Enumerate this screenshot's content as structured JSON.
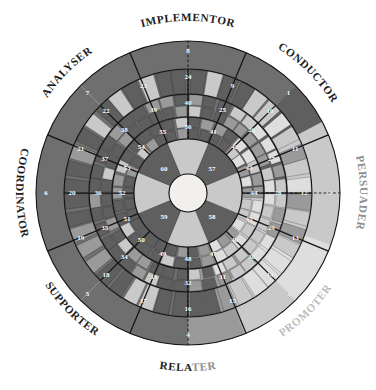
{
  "figure": {
    "type": "radial-segmented-wheel",
    "title_visible": false,
    "center_hub": "",
    "ring_count": 4,
    "sector_count": 8,
    "total_numbered_segments": 60
  },
  "colors": {
    "dark_gray": "#6f6f6f",
    "darker_gray": "#5f5f5f",
    "mid_gray": "#9a9a9a",
    "light_gray": "#c9c9c9",
    "pale_gray": "#dedede",
    "outline": "#141414",
    "hub": "#f2f0ec",
    "label_dark": "#1c1c1c",
    "label_mid": "#8d8d8d",
    "label_light": "#bdbdbd",
    "number_text": "#ffffff",
    "background": "#ffffff"
  },
  "sector_labels": [
    {
      "id": "implementor",
      "text": "IMPLEMENTOR",
      "tone": "dark",
      "position": "top"
    },
    {
      "id": "conductor",
      "text": "CONDUCTOR",
      "tone": "dark",
      "position": "top-right"
    },
    {
      "id": "persuader",
      "text": "PERSUADER",
      "tone": "mid",
      "position": "right"
    },
    {
      "id": "promoter",
      "text": "PROMOTER",
      "tone": "light",
      "position": "bottom-right"
    },
    {
      "id": "relater",
      "text": "RELATER",
      "tone": "split",
      "position": "bottom",
      "text_dark": "RELA",
      "text_light": "TER"
    },
    {
      "id": "supporter",
      "text": "SUPPORTER",
      "tone": "dark",
      "position": "bottom-left"
    },
    {
      "id": "coordinator",
      "text": "COORDINATOR",
      "tone": "dark",
      "position": "left"
    },
    {
      "id": "analyser",
      "text": "ANALYSER",
      "tone": "dark",
      "position": "top-left"
    }
  ],
  "chart_data": {
    "type": "pie",
    "title": "",
    "xlabel": "",
    "ylabel": "",
    "legend_position": "around-perimeter",
    "grid": false,
    "categories": [
      "IMPLEMENTOR",
      "CONDUCTOR",
      "PERSUADER",
      "PROMOTER",
      "RELATER",
      "SUPPORTER",
      "COORDINATOR",
      "ANALYSER"
    ],
    "values": [
      12.5,
      12.5,
      12.5,
      12.5,
      12.5,
      12.5,
      12.5,
      12.5
    ],
    "rings": [
      {
        "ring": 1,
        "name": "outer-ring",
        "segments": [
          {
            "n": 1,
            "sector": "CONDUCTOR",
            "shade": "dark"
          },
          {
            "n": 2,
            "sector": "PERSUADER",
            "shade": "dark"
          },
          {
            "n": 3,
            "sector": "PROMOTER",
            "shade": "pale"
          },
          {
            "n": 4,
            "sector": "RELATER",
            "shade": "light"
          },
          {
            "n": 5,
            "sector": "SUPPORTER",
            "shade": "dark"
          },
          {
            "n": 6,
            "sector": "COORDINATOR",
            "shade": "dark"
          },
          {
            "n": 7,
            "sector": "ANALYSER",
            "shade": "dark"
          },
          {
            "n": 8,
            "sector": "IMPLEMENTOR",
            "shade": "dark"
          }
        ]
      },
      {
        "ring": 2,
        "name": "second-ring",
        "segments": [
          {
            "n": 9,
            "sector": "IMPLEMENTOR",
            "shade": "dark"
          },
          {
            "n": 10,
            "sector": "CONDUCTOR",
            "shade": "dark"
          },
          {
            "n": 11,
            "sector": "CONDUCTOR",
            "shade": "dark"
          },
          {
            "n": 12,
            "sector": "PERSUADER",
            "shade": "dark"
          },
          {
            "n": 13,
            "sector": "PERSUADER",
            "shade": "light"
          },
          {
            "n": 14,
            "sector": "PROMOTER",
            "shade": "light"
          },
          {
            "n": 15,
            "sector": "PROMOTER",
            "shade": "light"
          },
          {
            "n": 16,
            "sector": "RELATER",
            "shade": "light"
          },
          {
            "n": 17,
            "sector": "RELATER",
            "shade": "light"
          },
          {
            "n": 18,
            "sector": "SUPPORTER",
            "shade": "dark"
          },
          {
            "n": 19,
            "sector": "SUPPORTER",
            "shade": "dark"
          },
          {
            "n": 20,
            "sector": "COORDINATOR",
            "shade": "dark"
          },
          {
            "n": 21,
            "sector": "COORDINATOR",
            "shade": "dark"
          },
          {
            "n": 22,
            "sector": "ANALYSER",
            "shade": "dark"
          },
          {
            "n": 23,
            "sector": "ANALYSER",
            "shade": "dark"
          },
          {
            "n": 24,
            "sector": "IMPLEMENTOR",
            "shade": "dark"
          }
        ]
      },
      {
        "ring": 3,
        "name": "third-ring",
        "segments": [
          {
            "n": 25,
            "sector": "IMPLEMENTOR",
            "shade": "mottled"
          },
          {
            "n": 26,
            "sector": "CONDUCTOR",
            "shade": "mottled"
          },
          {
            "n": 27,
            "sector": "CONDUCTOR",
            "shade": "mottled"
          },
          {
            "n": 28,
            "sector": "PERSUADER",
            "shade": "mottled"
          },
          {
            "n": 29,
            "sector": "PERSUADER",
            "shade": "mottled"
          },
          {
            "n": 30,
            "sector": "PERSUADER",
            "shade": "mottled"
          },
          {
            "n": 31,
            "sector": "PROMOTER",
            "shade": "mottled"
          },
          {
            "n": 32,
            "sector": "RELATER",
            "shade": "mottled"
          },
          {
            "n": 33,
            "sector": "RELATER",
            "shade": "mottled"
          },
          {
            "n": 34,
            "sector": "SUPPORTER",
            "shade": "mottled"
          },
          {
            "n": 35,
            "sector": "SUPPORTER",
            "shade": "mottled"
          },
          {
            "n": 36,
            "sector": "COORDINATOR",
            "shade": "mottled"
          },
          {
            "n": 37,
            "sector": "COORDINATOR",
            "shade": "mottled"
          },
          {
            "n": 38,
            "sector": "ANALYSER",
            "shade": "mottled"
          },
          {
            "n": 39,
            "sector": "ANALYSER",
            "shade": "mottled"
          },
          {
            "n": 40,
            "sector": "IMPLEMENTOR",
            "shade": "mottled"
          }
        ]
      },
      {
        "ring": 4,
        "name": "fourth-ring",
        "segments": [
          {
            "n": 41,
            "sector": "IMPLEMENTOR",
            "shade": "mottled"
          },
          {
            "n": 42,
            "sector": "CONDUCTOR",
            "shade": "mottled"
          },
          {
            "n": 43,
            "sector": "CONDUCTOR",
            "shade": "mottled"
          },
          {
            "n": 44,
            "sector": "PERSUADER",
            "shade": "mottled"
          },
          {
            "n": 45,
            "sector": "PERSUADER",
            "shade": "mottled"
          },
          {
            "n": 46,
            "sector": "PROMOTER",
            "shade": "mottled"
          },
          {
            "n": 47,
            "sector": "PROMOTER",
            "shade": "mottled"
          },
          {
            "n": 48,
            "sector": "RELATER",
            "shade": "mottled"
          },
          {
            "n": 49,
            "sector": "RELATER",
            "shade": "mottled"
          },
          {
            "n": 50,
            "sector": "SUPPORTER",
            "shade": "mottled"
          },
          {
            "n": 51,
            "sector": "SUPPORTER",
            "shade": "mottled"
          },
          {
            "n": 52,
            "sector": "COORDINATOR",
            "shade": "mottled"
          },
          {
            "n": 53,
            "sector": "COORDINATOR",
            "shade": "mottled"
          },
          {
            "n": 54,
            "sector": "ANALYSER",
            "shade": "mottled"
          },
          {
            "n": 55,
            "sector": "ANALYSER",
            "shade": "mottled"
          },
          {
            "n": 56,
            "sector": "IMPLEMENTOR",
            "shade": "mottled"
          }
        ]
      },
      {
        "ring": 5,
        "name": "inner-hub-ring",
        "segments": [
          {
            "n": 57,
            "sector": "CONDUCTOR",
            "shade": "dark"
          },
          {
            "n": 58,
            "sector": "PROMOTER",
            "shade": "light"
          },
          {
            "n": 59,
            "sector": "SUPPORTER",
            "shade": "light"
          },
          {
            "n": 60,
            "sector": "ANALYSER",
            "shade": "light"
          }
        ]
      }
    ]
  },
  "ring_numbers": {
    "r1": [
      "1",
      "2",
      "3",
      "4",
      "5",
      "6",
      "7",
      "8"
    ],
    "r2": [
      "9",
      "10",
      "11",
      "12",
      "13",
      "14",
      "15",
      "16",
      "17",
      "18",
      "19",
      "20",
      "21",
      "22",
      "23",
      "24"
    ],
    "r3": [
      "25",
      "26",
      "27",
      "28",
      "29",
      "30",
      "31",
      "32",
      "33",
      "34",
      "35",
      "36",
      "37",
      "38",
      "39",
      "40"
    ],
    "r4": [
      "41",
      "42",
      "43",
      "44",
      "45",
      "46",
      "47",
      "48",
      "49",
      "50",
      "51",
      "52",
      "53",
      "54",
      "55",
      "56"
    ],
    "r5": [
      "57",
      "58",
      "59",
      "60"
    ]
  }
}
